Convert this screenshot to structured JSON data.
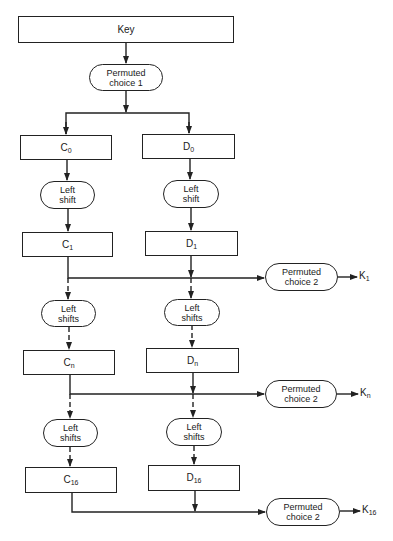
{
  "diagram": {
    "type": "DES key schedule flowchart",
    "key": {
      "label": "Key"
    },
    "pc1": {
      "line1": "Permuted",
      "line2": "choice 1"
    },
    "rounds": [
      {
        "c": {
          "base": "C",
          "sub": "0"
        },
        "d": {
          "base": "D",
          "sub": "0"
        }
      },
      {
        "shift_left": {
          "line1": "Left",
          "line2": "shift"
        },
        "shift_right": {
          "line1": "Left",
          "line2": "shift"
        },
        "c": {
          "base": "C",
          "sub": "1"
        },
        "d": {
          "base": "D",
          "sub": "1"
        },
        "pc2": {
          "line1": "Permuted",
          "line2": "choice 2"
        },
        "k": {
          "base": "K",
          "sub": "1"
        }
      },
      {
        "shift_left": {
          "line1": "Left",
          "line2": "shifts"
        },
        "shift_right": {
          "line1": "Left",
          "line2": "shifts"
        },
        "c": {
          "base": "C",
          "sub": "n"
        },
        "d": {
          "base": "D",
          "sub": "n"
        },
        "pc2": {
          "line1": "Permuted",
          "line2": "choice 2"
        },
        "k": {
          "base": "K",
          "sub": "n"
        }
      },
      {
        "shift_left": {
          "line1": "Left",
          "line2": "shifts"
        },
        "shift_right": {
          "line1": "Left",
          "line2": "shifts"
        },
        "c": {
          "base": "C",
          "sub": "16"
        },
        "d": {
          "base": "D",
          "sub": "16"
        },
        "pc2": {
          "line1": "Permuted",
          "line2": "choice 2"
        },
        "k": {
          "base": "K",
          "sub": "16"
        }
      }
    ],
    "colors": {
      "stroke": "#222222",
      "background": "#ffffff"
    }
  }
}
